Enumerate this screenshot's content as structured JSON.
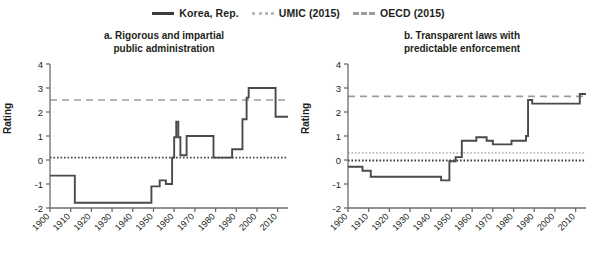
{
  "legend": {
    "items": [
      {
        "label": "Korea, Rep.",
        "style": "solid",
        "color": "#3c3c3c",
        "icon": "line-solid-icon"
      },
      {
        "label": "UMIC (2015)",
        "style": "dotted",
        "color": "#b9b9b9",
        "icon": "line-dotted-icon"
      },
      {
        "label": "OECD (2015)",
        "style": "dashed",
        "color": "#9d9d9d",
        "icon": "line-dashed-icon"
      }
    ]
  },
  "panels": {
    "a": {
      "title_line1": "a. Rigorous and impartial",
      "title_line2": "public administration",
      "ylabel": "Rating"
    },
    "b": {
      "title_line1": "b. Transparent laws with",
      "title_line2": "predictable enforcement",
      "ylabel": "Rating"
    }
  },
  "chart_data": [
    {
      "type": "line",
      "panel": "a",
      "title": "a. Rigorous and impartial public administration",
      "xlabel": "",
      "ylabel": "Rating",
      "xlim": [
        1900,
        2015
      ],
      "ylim": [
        -2,
        4
      ],
      "yticks": [
        4,
        3,
        2,
        1,
        0,
        -1,
        -2
      ],
      "xticks": [
        1900,
        1910,
        1920,
        1930,
        1940,
        1950,
        1960,
        1970,
        1980,
        1990,
        2000,
        2010
      ],
      "grid": false,
      "legend_position": "top-center",
      "reference_lines": [
        {
          "name": "OECD (2015)",
          "value": 2.5,
          "style": "dashed",
          "color": "#9d9d9d"
        },
        {
          "name": "UMIC (2015)",
          "value": 0.1,
          "style": "dotted",
          "color": "#4a4a4a"
        }
      ],
      "series": [
        {
          "name": "Korea, Rep.",
          "color": "#4a4a4a",
          "style": "solid",
          "x": [
            1900,
            1909,
            1910,
            1912,
            1913,
            1948,
            1949,
            1952,
            1953,
            1955,
            1956,
            1958,
            1959,
            1960,
            1961,
            1962,
            1963,
            1965,
            1966,
            1972,
            1973,
            1979,
            1980,
            1987,
            1988,
            1992,
            1993,
            1995,
            1996,
            2008,
            2009,
            2015
          ],
          "y": [
            -0.65,
            -0.65,
            -0.65,
            -1.78,
            -1.78,
            -1.78,
            -1.1,
            -1.1,
            -0.85,
            -0.85,
            -1.0,
            -1.0,
            0.1,
            0.95,
            1.6,
            0.95,
            0.2,
            0.2,
            1.0,
            1.0,
            1.0,
            0.1,
            0.1,
            0.1,
            0.45,
            0.45,
            1.7,
            2.6,
            3.0,
            3.0,
            1.8,
            1.8
          ]
        }
      ]
    },
    {
      "type": "line",
      "panel": "b",
      "title": "b. Transparent laws with predictable enforcement",
      "xlabel": "",
      "ylabel": "Rating",
      "xlim": [
        1900,
        2015
      ],
      "ylim": [
        -2,
        4
      ],
      "yticks": [
        4,
        3,
        2,
        1,
        0,
        -1,
        -2
      ],
      "xticks": [
        1900,
        1910,
        1920,
        1930,
        1940,
        1950,
        1960,
        1970,
        1980,
        1990,
        2000,
        2010
      ],
      "grid": false,
      "legend_position": "top-center",
      "reference_lines": [
        {
          "name": "OECD (2015)",
          "value": 2.65,
          "style": "dashed",
          "color": "#9d9d9d"
        },
        {
          "name": "UMIC (2015)",
          "value": 0.3,
          "style": "dotted",
          "color": "#b9b9b9"
        },
        {
          "name": "zero",
          "value": -0.02,
          "style": "dotted",
          "color": "#3c3c3c"
        }
      ],
      "series": [
        {
          "name": "Korea, Rep.",
          "color": "#4a4a4a",
          "style": "solid",
          "x": [
            1900,
            1906,
            1907,
            1910,
            1911,
            1944,
            1945,
            1948,
            1949,
            1951,
            1952,
            1954,
            1955,
            1961,
            1962,
            1967,
            1968,
            1970,
            1971,
            1979,
            1980,
            1986,
            1987,
            1989,
            1990,
            2011,
            2012,
            2015
          ],
          "y": [
            -0.28,
            -0.28,
            -0.45,
            -0.45,
            -0.7,
            -0.7,
            -0.85,
            -0.85,
            -0.05,
            -0.05,
            0.12,
            0.12,
            0.8,
            0.8,
            0.95,
            0.8,
            0.8,
            0.65,
            0.65,
            0.8,
            0.8,
            1.0,
            2.5,
            2.35,
            2.35,
            2.35,
            2.75,
            2.75
          ]
        }
      ]
    }
  ]
}
